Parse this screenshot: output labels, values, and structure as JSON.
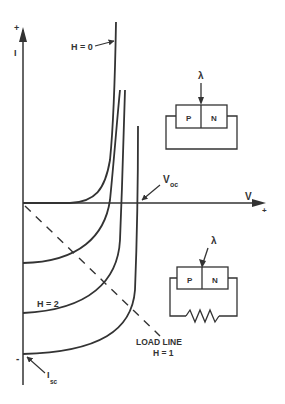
{
  "diagram": {
    "axes": {
      "y_label": "I",
      "y_plus": "+",
      "y_minus": "-",
      "x_label": "V",
      "x_plus": "+"
    },
    "curve_labels": {
      "h0": "H = 0",
      "h2": "H = 2",
      "h1": "H = 1"
    },
    "annotations": {
      "voc": "V",
      "voc_sub": "oc",
      "isc": "I",
      "isc_sub": "sc",
      "load_line": "LOAD LINE"
    },
    "circuits": {
      "top": {
        "light": "λ",
        "p": "P",
        "n": "N",
        "type": "short-circuit"
      },
      "bottom": {
        "light": "λ",
        "p": "P",
        "n": "N",
        "type": "resistive-load"
      }
    },
    "colors": {
      "ink": "#333333",
      "background": "#ffffff"
    }
  }
}
